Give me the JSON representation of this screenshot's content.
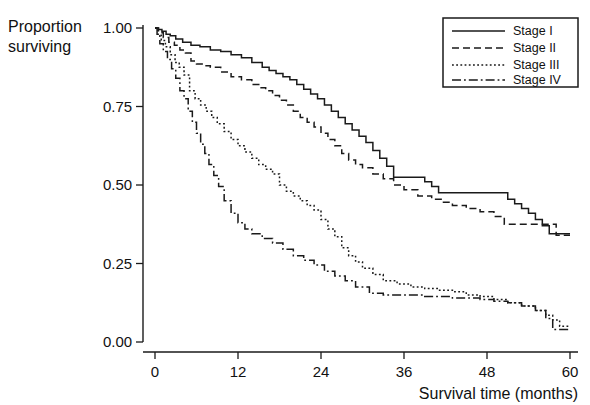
{
  "chart_data": {
    "type": "line",
    "title": "",
    "subtitle": "",
    "xlabel": "Survival time (months)",
    "ylabel": "Proportion surviving",
    "ylabel_line1": "Proportion",
    "ylabel_line2": "surviving",
    "xlim": [
      0,
      60
    ],
    "ylim": [
      0.0,
      1.0
    ],
    "xticks": [
      0,
      12,
      24,
      36,
      48,
      60
    ],
    "xtick_labels": [
      "0",
      "12",
      "24",
      "36",
      "48",
      "60"
    ],
    "yticks": [
      0.0,
      0.25,
      0.5,
      0.75,
      1.0
    ],
    "ytick_labels": [
      "0.00",
      "0.25",
      "0.50",
      "0.75",
      "1.00"
    ],
    "grid": false,
    "legend_position": "top-right",
    "plot_style": "step-post",
    "series": [
      {
        "name": "Stage I",
        "linestyle": "solid",
        "color": "#1a1a1a",
        "x": [
          0,
          0.5,
          1.0,
          1.6,
          2.2,
          3.0,
          4.0,
          5.2,
          6.5,
          8.0,
          9.5,
          11.0,
          12.5,
          14.0,
          15.5,
          16.5,
          17.5,
          18.5,
          19.5,
          20.5,
          21.5,
          22.5,
          23.5,
          24.5,
          25.5,
          26.5,
          27.5,
          28.5,
          29.5,
          30.5,
          31.5,
          32.5,
          33.5,
          34.5,
          38.0,
          39.0,
          40.0,
          41.0,
          49.5,
          51.0,
          52.0,
          53.0,
          54.0,
          55.0,
          56.0,
          57.0,
          60
        ],
        "y": [
          1.0,
          0.995,
          0.99,
          0.98,
          0.975,
          0.965,
          0.955,
          0.945,
          0.94,
          0.93,
          0.925,
          0.915,
          0.905,
          0.89,
          0.875,
          0.865,
          0.855,
          0.845,
          0.835,
          0.82,
          0.805,
          0.79,
          0.775,
          0.755,
          0.735,
          0.715,
          0.695,
          0.675,
          0.655,
          0.635,
          0.61,
          0.585,
          0.56,
          0.525,
          0.525,
          0.51,
          0.495,
          0.475,
          0.475,
          0.455,
          0.44,
          0.425,
          0.41,
          0.39,
          0.37,
          0.345,
          0.345
        ]
      },
      {
        "name": "Stage II",
        "linestyle": "dashed",
        "color": "#1a1a1a",
        "x": [
          0,
          0.5,
          1.2,
          2.0,
          2.8,
          3.6,
          4.4,
          5.2,
          6.0,
          7.0,
          8.0,
          9.5,
          11.0,
          12.5,
          14.0,
          15.0,
          16.0,
          17.0,
          18.0,
          19.0,
          20.0,
          21.0,
          22.0,
          23.0,
          24.0,
          25.0,
          26.0,
          27.0,
          28.0,
          29.0,
          30.0,
          31.5,
          33.0,
          34.5,
          36.0,
          38.0,
          40.0,
          41.5,
          43.0,
          45.0,
          47.0,
          49.0,
          50.5,
          54.0,
          58.0,
          60
        ],
        "y": [
          1.0,
          0.985,
          0.97,
          0.955,
          0.945,
          0.93,
          0.92,
          0.895,
          0.885,
          0.88,
          0.875,
          0.86,
          0.845,
          0.835,
          0.82,
          0.81,
          0.8,
          0.785,
          0.77,
          0.755,
          0.735,
          0.715,
          0.7,
          0.685,
          0.665,
          0.645,
          0.625,
          0.6,
          0.58,
          0.565,
          0.555,
          0.535,
          0.52,
          0.5,
          0.485,
          0.465,
          0.455,
          0.445,
          0.435,
          0.425,
          0.415,
          0.4,
          0.375,
          0.375,
          0.34,
          0.34
        ]
      },
      {
        "name": "Stage III",
        "linestyle": "dotted",
        "color": "#1a1a1a",
        "x": [
          0,
          0.4,
          0.9,
          1.5,
          2.2,
          2.9,
          3.5,
          4.2,
          5.0,
          5.8,
          6.6,
          7.4,
          8.2,
          9.0,
          10.0,
          11.0,
          12.0,
          13.0,
          14.0,
          15.0,
          16.0,
          17.0,
          18.0,
          19.0,
          20.0,
          21.0,
          22.0,
          23.0,
          24.0,
          25.0,
          26.0,
          27.0,
          28.0,
          29.0,
          30.0,
          31.5,
          33.0,
          35.0,
          37.0,
          39.0,
          41.0,
          43.0,
          45.0,
          47.0,
          49.0,
          51.0,
          53.0,
          55.0,
          56.5,
          57.5,
          58.5,
          60
        ],
        "y": [
          1.0,
          0.98,
          0.96,
          0.94,
          0.915,
          0.89,
          0.875,
          0.85,
          0.8,
          0.775,
          0.755,
          0.735,
          0.715,
          0.695,
          0.67,
          0.645,
          0.625,
          0.605,
          0.585,
          0.565,
          0.55,
          0.535,
          0.5,
          0.48,
          0.465,
          0.45,
          0.435,
          0.42,
          0.39,
          0.36,
          0.335,
          0.3,
          0.275,
          0.255,
          0.235,
          0.215,
          0.195,
          0.185,
          0.175,
          0.17,
          0.165,
          0.16,
          0.15,
          0.145,
          0.135,
          0.125,
          0.115,
          0.1,
          0.085,
          0.07,
          0.05,
          0.05
        ]
      },
      {
        "name": "Stage IV",
        "linestyle": "dashdot",
        "color": "#1a1a1a",
        "x": [
          0,
          0.3,
          0.7,
          1.2,
          1.8,
          2.4,
          3.0,
          3.6,
          4.2,
          4.8,
          5.4,
          6.0,
          6.6,
          7.2,
          7.8,
          8.5,
          9.2,
          10.0,
          11.0,
          12.0,
          13.0,
          14.0,
          15.5,
          17.0,
          18.5,
          20.0,
          21.5,
          23.0,
          24.5,
          26.0,
          27.5,
          29.0,
          31.0,
          33.0,
          35.0,
          37.0,
          39.0,
          41.0,
          43.0,
          45.0,
          47.0,
          49.0,
          51.0,
          53.0,
          55.0,
          56.5,
          57.5,
          60
        ],
        "y": [
          1.0,
          0.975,
          0.95,
          0.925,
          0.9,
          0.87,
          0.84,
          0.8,
          0.775,
          0.735,
          0.7,
          0.665,
          0.63,
          0.6,
          0.565,
          0.53,
          0.495,
          0.45,
          0.41,
          0.38,
          0.36,
          0.345,
          0.33,
          0.315,
          0.295,
          0.275,
          0.26,
          0.245,
          0.225,
          0.21,
          0.195,
          0.175,
          0.155,
          0.15,
          0.15,
          0.15,
          0.145,
          0.145,
          0.14,
          0.14,
          0.135,
          0.13,
          0.125,
          0.115,
          0.1,
          0.075,
          0.04,
          0.04
        ]
      }
    ]
  },
  "legend": {
    "items": [
      {
        "label": "Stage I",
        "style": "solid"
      },
      {
        "label": "Stage II",
        "style": "dashed"
      },
      {
        "label": "Stage III",
        "style": "dotted"
      },
      {
        "label": "Stage IV",
        "style": "dashdot"
      }
    ]
  },
  "colors": {
    "ink": "#1a1a1a",
    "background": "#ffffff"
  }
}
